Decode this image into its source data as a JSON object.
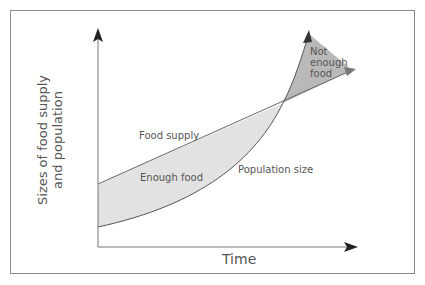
{
  "diagram": {
    "x_axis_label": "Time",
    "y_axis_label_line1": "Sizes of food supply",
    "y_axis_label_line2": "and population",
    "labels": {
      "food_supply": "Food supply",
      "population_size": "Population size",
      "enough_food": "Enough food",
      "not_enough_line1": "Not",
      "not_enough_line2": "enough",
      "not_enough_line3": "food"
    },
    "colors": {
      "enough_fill": "#e2e2e2",
      "not_enough_fill": "#b9b9b9",
      "axis": "#333333",
      "curve": "#666666",
      "frame": "#8a8a8a"
    }
  }
}
